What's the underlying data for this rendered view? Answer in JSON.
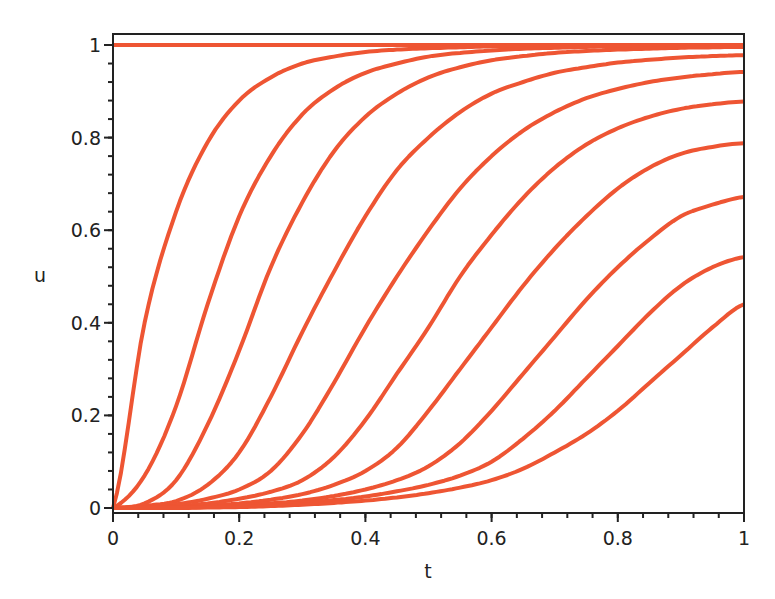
{
  "chart_data": {
    "type": "line",
    "title": "",
    "xlabel": "t",
    "ylabel": "u",
    "xlim": [
      0,
      1
    ],
    "ylim": [
      0,
      1
    ],
    "grid": false,
    "legend": null,
    "line_color": "#ee5533",
    "xticks": [
      {
        "value": 0,
        "label": "0"
      },
      {
        "value": 0.2,
        "label": "0.2"
      },
      {
        "value": 0.4,
        "label": "0.4"
      },
      {
        "value": 0.6,
        "label": "0.6"
      },
      {
        "value": 0.8,
        "label": "0.8"
      },
      {
        "value": 1,
        "label": "1"
      }
    ],
    "yticks": [
      {
        "value": 0,
        "label": "0"
      },
      {
        "value": 0.2,
        "label": "0.2"
      },
      {
        "value": 0.4,
        "label": "0.4"
      },
      {
        "value": 0.6,
        "label": "0.6"
      },
      {
        "value": 0.8,
        "label": "0.8"
      },
      {
        "value": 1,
        "label": "1"
      }
    ],
    "x": [
      0,
      0.05,
      0.1,
      0.15,
      0.2,
      0.25,
      0.3,
      0.35,
      0.4,
      0.45,
      0.5,
      0.55,
      0.6,
      0.65,
      0.7,
      0.75,
      0.8,
      0.85,
      0.9,
      0.95,
      1.0
    ],
    "series": [
      {
        "name": "u0",
        "values": [
          1,
          1,
          1,
          1,
          1,
          1,
          1,
          1,
          1,
          1,
          1,
          1,
          1,
          1,
          1,
          1,
          1,
          1,
          1,
          1,
          1
        ]
      },
      {
        "name": "u1",
        "values": [
          0,
          0.4,
          0.64,
          0.79,
          0.88,
          0.93,
          0.96,
          0.975,
          0.985,
          0.99,
          0.993,
          0.995,
          0.997,
          0.998,
          0.998,
          0.999,
          0.999,
          1,
          1,
          1,
          1
        ]
      },
      {
        "name": "u2",
        "values": [
          0,
          0.07,
          0.22,
          0.44,
          0.63,
          0.76,
          0.85,
          0.905,
          0.94,
          0.96,
          0.975,
          0.983,
          0.988,
          0.992,
          0.994,
          0.996,
          0.997,
          0.998,
          0.998,
          0.999,
          0.999
        ]
      },
      {
        "name": "u3",
        "values": [
          0,
          0.01,
          0.06,
          0.18,
          0.34,
          0.52,
          0.66,
          0.77,
          0.845,
          0.895,
          0.93,
          0.952,
          0.967,
          0.976,
          0.983,
          0.987,
          0.99,
          0.992,
          0.994,
          0.995,
          0.996
        ]
      },
      {
        "name": "u4",
        "values": [
          0,
          0.005,
          0.015,
          0.05,
          0.12,
          0.24,
          0.38,
          0.51,
          0.63,
          0.73,
          0.8,
          0.855,
          0.895,
          0.92,
          0.94,
          0.952,
          0.962,
          0.968,
          0.973,
          0.976,
          0.978
        ]
      },
      {
        "name": "u5",
        "values": [
          0,
          0.002,
          0.008,
          0.02,
          0.04,
          0.08,
          0.16,
          0.27,
          0.39,
          0.5,
          0.6,
          0.69,
          0.76,
          0.815,
          0.855,
          0.885,
          0.905,
          0.92,
          0.93,
          0.937,
          0.942
        ]
      },
      {
        "name": "u6",
        "values": [
          0,
          0.001,
          0.004,
          0.01,
          0.02,
          0.035,
          0.06,
          0.11,
          0.19,
          0.29,
          0.39,
          0.5,
          0.59,
          0.67,
          0.735,
          0.785,
          0.82,
          0.845,
          0.862,
          0.872,
          0.878
        ]
      },
      {
        "name": "u7",
        "values": [
          0,
          0,
          0.002,
          0.005,
          0.01,
          0.018,
          0.03,
          0.05,
          0.08,
          0.13,
          0.21,
          0.3,
          0.39,
          0.48,
          0.56,
          0.63,
          0.69,
          0.735,
          0.765,
          0.78,
          0.788
        ]
      },
      {
        "name": "u8",
        "values": [
          0,
          0,
          0.001,
          0.003,
          0.006,
          0.01,
          0.016,
          0.026,
          0.04,
          0.06,
          0.09,
          0.14,
          0.21,
          0.29,
          0.37,
          0.45,
          0.52,
          0.58,
          0.63,
          0.655,
          0.672
        ]
      },
      {
        "name": "u9",
        "values": [
          0,
          0,
          0,
          0.002,
          0.004,
          0.007,
          0.011,
          0.017,
          0.025,
          0.036,
          0.05,
          0.07,
          0.1,
          0.15,
          0.21,
          0.28,
          0.35,
          0.42,
          0.48,
          0.52,
          0.542
        ]
      },
      {
        "name": "u10",
        "values": [
          0,
          0,
          0,
          0.001,
          0.002,
          0.004,
          0.007,
          0.011,
          0.016,
          0.023,
          0.032,
          0.044,
          0.06,
          0.085,
          0.12,
          0.16,
          0.21,
          0.27,
          0.33,
          0.39,
          0.44
        ]
      }
    ]
  }
}
